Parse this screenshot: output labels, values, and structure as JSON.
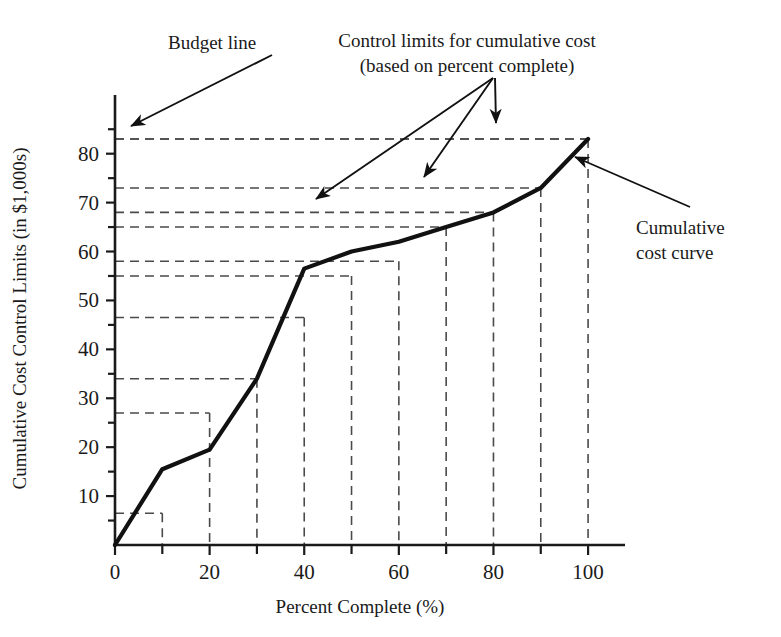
{
  "chart_data": {
    "type": "line",
    "title": "",
    "xlabel": "Percent Complete (%)",
    "ylabel": "Cumulative Cost Control Limits (in $1,000s)",
    "xlim": [
      0,
      104
    ],
    "ylim": [
      0,
      92
    ],
    "xticks_major": [
      0,
      20,
      40,
      60,
      80,
      100
    ],
    "xticks_major_labels": [
      "0",
      "20",
      "40",
      "60",
      "80",
      "100"
    ],
    "xticks_minor": [
      10,
      30,
      50,
      70,
      90
    ],
    "yticks_major": [
      10,
      20,
      30,
      40,
      50,
      60,
      70,
      80
    ],
    "yticks_major_labels": [
      "10",
      "20",
      "30",
      "40",
      "50",
      "60",
      "70",
      "80"
    ],
    "yticks_minor": [
      5,
      15,
      25,
      35,
      45,
      55,
      65,
      75,
      85
    ],
    "grid": false,
    "legend": "none",
    "series": [
      {
        "name": "Cumulative cost curve",
        "style": "solid-thick",
        "x": [
          0,
          10,
          20,
          30,
          40,
          50,
          60,
          70,
          80,
          90,
          100
        ],
        "values": [
          0,
          15.5,
          19.5,
          34.0,
          56.5,
          60.0,
          62.0,
          65.0,
          68.0,
          73.0,
          83.0
        ]
      },
      {
        "name": "Budget line",
        "style": "dashed",
        "x": [
          0,
          100
        ],
        "values": [
          83.0,
          83.0
        ]
      }
    ],
    "control_limits": {
      "description": "Nested step rectangles: each control limit is a horizontal dashed line from x=0 out to its percent-complete boundary, then drops vertically to the x-axis.",
      "levels": [
        {
          "percent_complete": 10,
          "limit": 6.5
        },
        {
          "percent_complete": 20,
          "limit": 27.0
        },
        {
          "percent_complete": 30,
          "limit": 34.0
        },
        {
          "percent_complete": 40,
          "limit": 46.5
        },
        {
          "percent_complete": 50,
          "limit": 55.0
        },
        {
          "percent_complete": 60,
          "limit": 58.0
        },
        {
          "percent_complete": 70,
          "limit": 65.0
        },
        {
          "percent_complete": 80,
          "limit": 68.0
        },
        {
          "percent_complete": 90,
          "limit": 73.0
        },
        {
          "percent_complete": 100,
          "limit": 83.0
        }
      ]
    },
    "annotations": [
      {
        "name": "budget-line",
        "text": "Budget line",
        "points_to": {
          "x": 4,
          "y": 83
        }
      },
      {
        "name": "control-limits",
        "text_line1": "Control limits for cumulative cost",
        "text_line2": "(based on percent complete)",
        "points_to": [
          {
            "x": 41,
            "y": 68
          },
          {
            "x": 61,
            "y": 73
          },
          {
            "x": 77,
            "y": 83
          }
        ]
      },
      {
        "name": "cumulative-cost-curve",
        "text_line1": "Cumulative",
        "text_line2": "cost curve",
        "points_to": {
          "x": 93,
          "y": 77
        }
      }
    ],
    "colors": {
      "axis": "#1a1a1a",
      "curve": "#111111",
      "dashed": "#4a4a4a",
      "text": "#1a1a1a",
      "background": "#ffffff"
    }
  }
}
